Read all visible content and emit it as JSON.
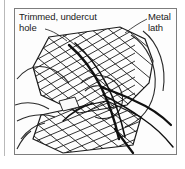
{
  "figure": {
    "type": "technical-illustration",
    "panel_background_color": "#fdfdfd",
    "panel_border_color": "#7d7d7d",
    "line_color": "#1c1c1c",
    "callouts": [
      {
        "id": "trimmed-hole",
        "line1": "Trimmed, undercut",
        "line2": "hole",
        "position": "top-left",
        "has_leader_line": true
      },
      {
        "id": "metal-lath",
        "line1": "Metal",
        "line2": "lath",
        "position": "top-right",
        "has_leader_line": true
      }
    ],
    "elements": {
      "upper_mesh_label": "metal lath sheet (upper)",
      "lower_mesh_label": "metal lath sheet (lower)",
      "hand_label": "hand holding lath",
      "wire_label": "tie wire"
    }
  }
}
